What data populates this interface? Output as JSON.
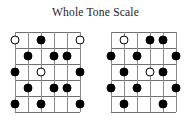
{
  "title": "Whole Tone Scale",
  "colors": {
    "background": "#ffffff",
    "title_text": "#1a1a1a",
    "fret_line": "#6f6f6f",
    "string_line": "#8a8a8a",
    "filled_dot": "#000000",
    "open_dot_fill": "#ffffff",
    "open_dot_border": "#000000"
  },
  "diagram_spec": {
    "strings": 6,
    "frets": 5,
    "string_spacing": 13,
    "fret_spacing": 16,
    "marker_types": [
      "filled",
      "open"
    ]
  },
  "diagrams": [
    {
      "name": "whole-tone-scale-pattern-1",
      "position": "left",
      "markers": [
        {
          "fret": 1,
          "string": 1,
          "type": "open"
        },
        {
          "fret": 1,
          "string": 3,
          "type": "filled"
        },
        {
          "fret": 1,
          "string": 6,
          "type": "open"
        },
        {
          "fret": 2,
          "string": 2,
          "type": "filled"
        },
        {
          "fret": 2,
          "string": 4,
          "type": "filled"
        },
        {
          "fret": 2,
          "string": 5,
          "type": "filled"
        },
        {
          "fret": 3,
          "string": 1,
          "type": "filled"
        },
        {
          "fret": 3,
          "string": 3,
          "type": "open"
        },
        {
          "fret": 3,
          "string": 6,
          "type": "filled"
        },
        {
          "fret": 4,
          "string": 2,
          "type": "filled"
        },
        {
          "fret": 4,
          "string": 4,
          "type": "filled"
        },
        {
          "fret": 4,
          "string": 5,
          "type": "filled"
        },
        {
          "fret": 5,
          "string": 1,
          "type": "filled"
        },
        {
          "fret": 5,
          "string": 3,
          "type": "filled"
        },
        {
          "fret": 5,
          "string": 6,
          "type": "filled"
        }
      ]
    },
    {
      "name": "whole-tone-scale-pattern-2",
      "position": "right",
      "markers": [
        {
          "fret": 1,
          "string": 2,
          "type": "open"
        },
        {
          "fret": 1,
          "string": 4,
          "type": "filled"
        },
        {
          "fret": 1,
          "string": 5,
          "type": "filled"
        },
        {
          "fret": 2,
          "string": 1,
          "type": "filled"
        },
        {
          "fret": 2,
          "string": 3,
          "type": "filled"
        },
        {
          "fret": 2,
          "string": 6,
          "type": "filled"
        },
        {
          "fret": 3,
          "string": 2,
          "type": "filled"
        },
        {
          "fret": 3,
          "string": 4,
          "type": "open"
        },
        {
          "fret": 3,
          "string": 5,
          "type": "filled"
        },
        {
          "fret": 4,
          "string": 1,
          "type": "filled"
        },
        {
          "fret": 4,
          "string": 3,
          "type": "filled"
        },
        {
          "fret": 4,
          "string": 6,
          "type": "filled"
        },
        {
          "fret": 5,
          "string": 2,
          "type": "filled"
        },
        {
          "fret": 5,
          "string": 5,
          "type": "filled"
        }
      ]
    }
  ]
}
